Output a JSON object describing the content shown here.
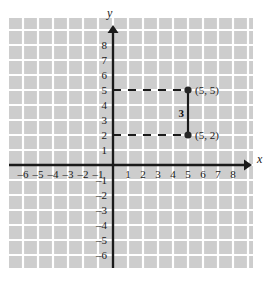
{
  "chart_data": {
    "type": "scatter",
    "title": "",
    "xlabel": "x",
    "ylabel": "y",
    "xlim": [
      -7,
      9
    ],
    "ylim": [
      -7,
      9
    ],
    "grid": true,
    "legend": null,
    "x_ticks": [
      -6,
      -5,
      -4,
      -3,
      -2,
      -1,
      1,
      2,
      3,
      4,
      5,
      6,
      7,
      8
    ],
    "y_ticks": [
      -6,
      -5,
      -4,
      -3,
      -2,
      -1,
      1,
      2,
      3,
      4,
      5,
      6,
      7,
      8
    ],
    "x_tick_labels": [
      "–6",
      "–5",
      "–4",
      "–3",
      "–2",
      "–1",
      "1",
      "2",
      "3",
      "4",
      "5",
      "6",
      "7",
      "8"
    ],
    "y_tick_labels": [
      "–6",
      "–5",
      "–4",
      "–3",
      "–2",
      "–1",
      "1",
      "2",
      "3",
      "4",
      "5",
      "6",
      "7",
      "8"
    ],
    "points": [
      {
        "name": "upper-point",
        "x": 5,
        "y": 5,
        "label": "(5, 5)"
      },
      {
        "name": "lower-point",
        "x": 5,
        "y": 2,
        "label": "(5, 2)"
      }
    ],
    "segments": [
      {
        "name": "vertical-distance-segment",
        "x1": 5,
        "y1": 5,
        "x2": 5,
        "y2": 2,
        "style": "solid",
        "label": "3"
      },
      {
        "name": "upper-guide-line",
        "x1": 0,
        "y1": 5,
        "x2": 5,
        "y2": 5,
        "style": "dashed",
        "label": ""
      },
      {
        "name": "lower-guide-line",
        "x1": 0,
        "y1": 2,
        "x2": 5,
        "y2": 2,
        "style": "dashed",
        "label": ""
      }
    ],
    "annotations": [
      {
        "name": "segment-length",
        "text": "3",
        "x": 4.55,
        "y": 3.5
      }
    ]
  },
  "axes": {
    "x_letter": "x",
    "y_letter": "y"
  },
  "colors": {
    "grid_fill": "#cdcdcd",
    "grid_line": "#ffffff",
    "axis": "#1a1a1a",
    "point": "#262626",
    "dash": "#1a1a1a",
    "background": "#ffffff"
  },
  "labels": {
    "point_upper": "(5, 5)",
    "point_lower": "(5, 2)",
    "distance": "3"
  }
}
